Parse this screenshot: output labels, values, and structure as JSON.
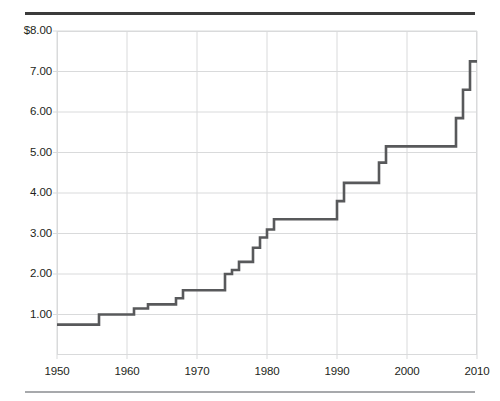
{
  "figure": {
    "background": "#ffffff",
    "rule_color_top": "#3b3b3b",
    "rule_color_bottom": "#a7a9ac",
    "grid_color": "#d9dadb",
    "line_color": "#58595b"
  },
  "chart_data": {
    "type": "line",
    "line_style": "step-post",
    "title": "",
    "subtitle": "",
    "xlabel": "",
    "ylabel": "",
    "xlim": [
      1950,
      2010
    ],
    "ylim": [
      0,
      8
    ],
    "grid": true,
    "legend": null,
    "x_ticks": [
      1950,
      1960,
      1970,
      1980,
      1990,
      2000,
      2010
    ],
    "x_tick_labels": [
      "1950",
      "1960",
      "1970",
      "1980",
      "1990",
      "2000",
      "2010"
    ],
    "y_ticks": [
      1,
      2,
      3,
      4,
      5,
      6,
      7,
      8
    ],
    "y_tick_labels": [
      "1.00",
      "2.00",
      "3.00",
      "4.00",
      "5.00",
      "6.00",
      "7.00",
      "$8.00"
    ],
    "x": [
      1950,
      1956,
      1961,
      1963,
      1967,
      1968,
      1974,
      1975,
      1976,
      1978,
      1979,
      1980,
      1981,
      1990,
      1991,
      1996,
      1997,
      2007,
      2008,
      2009,
      2010
    ],
    "values": [
      0.75,
      1.0,
      1.15,
      1.25,
      1.4,
      1.6,
      2.0,
      2.1,
      2.3,
      2.65,
      2.9,
      3.1,
      3.35,
      3.8,
      4.25,
      4.75,
      5.15,
      5.85,
      6.55,
      7.25,
      7.25
    ],
    "series": [
      {
        "name": "Minimum wage (nominal dollars per hour)",
        "values": [
          0.75,
          1.0,
          1.15,
          1.25,
          1.4,
          1.6,
          2.0,
          2.1,
          2.3,
          2.65,
          2.9,
          3.1,
          3.35,
          3.8,
          4.25,
          4.75,
          5.15,
          5.85,
          6.55,
          7.25,
          7.25
        ]
      }
    ],
    "annotations": []
  }
}
